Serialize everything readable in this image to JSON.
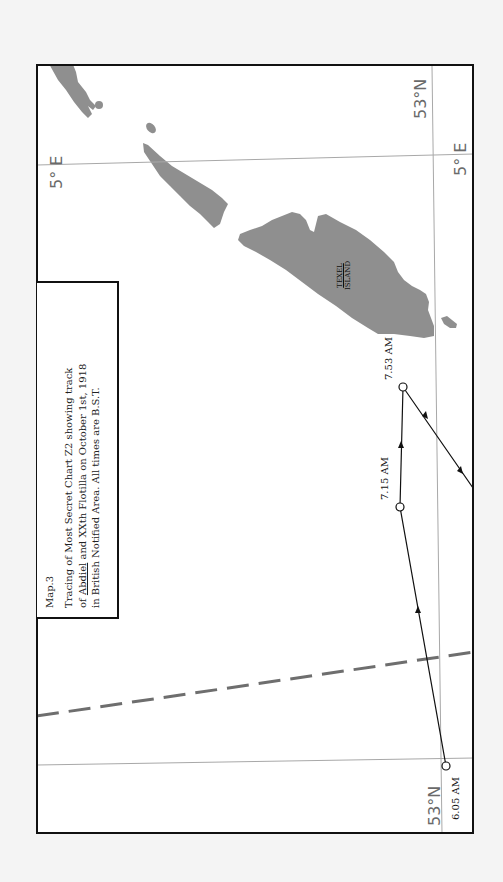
{
  "map": {
    "title": "Map.3",
    "caption_lines": [
      "Tracing of Most Secret Chart Z2 showing track",
      "of Abdiel and XXth Flotilla on October 1st, 1918",
      "in British Notified Area. All times are B.S.T."
    ],
    "caption_underlined": "Abdiel",
    "caption_line2_rest": " and XXth Flotilla on October 1st, 1918",
    "caption_line2_prefix": "of ",
    "grid_labels": {
      "lon_top_left": "5° E",
      "lon_top_right": "5° E",
      "lat_top_right": "53°N",
      "lat_bottom": "53°N"
    },
    "island_label_line1": "TEXEL",
    "island_label_line2": "ISLAND",
    "track_points": [
      {
        "time": "6.05 AM",
        "x": 446,
        "y": 766
      },
      {
        "time": "7.15 AM",
        "x": 400,
        "y": 507
      },
      {
        "time": "7.53 AM",
        "x": 403,
        "y": 387
      }
    ],
    "track_exit": {
      "x": 473,
      "y": 488
    },
    "colors": {
      "land": "#8f8f8f",
      "frame": "#111111",
      "grid": "#a8a8a8",
      "dashed_boundary": "#6e6e6e",
      "track": "#111111",
      "background": "#f4f4f4"
    }
  }
}
